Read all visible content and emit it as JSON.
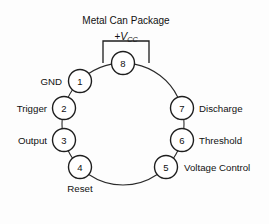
{
  "figure": {
    "title": "Metal Can Package",
    "supply": {
      "prefix": "+",
      "symbol": "V",
      "subscript": "CC",
      "full": "+VCC"
    },
    "package_type": "metal-can",
    "pin_count": 8,
    "geometry": {
      "center_x": 123,
      "center_y": 124,
      "ring_radius": 61,
      "pin_radius": 11.5
    },
    "colors": {
      "line": "#2b2b2b",
      "pin_stroke": "#1e1e1e",
      "pin_fill": "#ffffff",
      "text": "#111111",
      "background": "#fdfdfd"
    },
    "bracket": {
      "x": 103,
      "y": 41,
      "width": 46,
      "height": 22
    },
    "pins": [
      {
        "number": "1",
        "label": "GND",
        "angle": -135,
        "label_side": "left",
        "cx": 80,
        "cy": 81,
        "label_x": 62,
        "label_y": 81
      },
      {
        "number": "2",
        "label": "Trigger",
        "angle": -165,
        "label_side": "left",
        "cx": 64,
        "cy": 108,
        "label_x": 47,
        "label_y": 108
      },
      {
        "number": "3",
        "label": "Output",
        "angle": 165,
        "label_side": "left",
        "cx": 64,
        "cy": 140,
        "label_x": 47,
        "label_y": 140
      },
      {
        "number": "4",
        "label": "Reset",
        "angle": 135,
        "label_side": "mid",
        "cx": 80,
        "cy": 167,
        "label_x": 80,
        "label_y": 188
      },
      {
        "number": "5",
        "label": "Voltage Control",
        "angle": 45,
        "label_side": "right",
        "cx": 166,
        "cy": 167,
        "label_x": 184,
        "label_y": 167
      },
      {
        "number": "6",
        "label": "Threshold",
        "angle": 15,
        "label_side": "right",
        "cx": 182,
        "cy": 140,
        "label_x": 199,
        "label_y": 140
      },
      {
        "number": "7",
        "label": "Discharge",
        "angle": -15,
        "label_side": "right",
        "cx": 182,
        "cy": 108,
        "label_x": 199,
        "label_y": 108
      },
      {
        "number": "8",
        "label": "",
        "angle": -90,
        "label_side": "none",
        "cx": 123,
        "cy": 63,
        "label_x": 123,
        "label_y": 63
      }
    ]
  }
}
